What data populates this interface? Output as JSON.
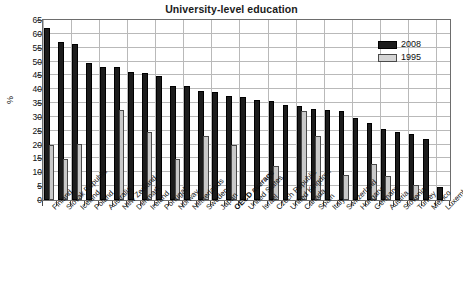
{
  "chart_data": {
    "type": "bar",
    "title": "University-level education",
    "xlabel": "",
    "ylabel": "%",
    "ylim": [
      0,
      65
    ],
    "ytick_step": 5,
    "yticks": [
      0,
      5,
      10,
      15,
      20,
      25,
      30,
      35,
      40,
      45,
      50,
      55,
      60,
      65
    ],
    "grid": true,
    "legend_position": "top-right",
    "highlight_category": "OECD average",
    "colors": {
      "series_2008": "#1c1c1c",
      "series_1995": "#c9c9c9",
      "grid": "#b9b9b9",
      "axis": "#6d6d6d",
      "text": "#111111"
    },
    "categories": [
      "Finland",
      "Slovak Republic",
      "Iceland",
      "Poland",
      "Australia",
      "New Zealand",
      "Denmark",
      "Ireland",
      "Portugal",
      "Norway",
      "Netherlands",
      "Sweden",
      "Japan",
      "OECD average",
      "United States",
      "Israel",
      "Czech Republic",
      "United Kingdom",
      "Canada",
      "Spain",
      "Italy",
      "Switzerland",
      "Hungary",
      "Germany",
      "Austria",
      "Slovenia",
      "Turkey",
      "Mexico",
      "Luxembourg"
    ],
    "series": [
      {
        "name": "2008",
        "values": [
          62.0,
          57.0,
          56.5,
          49.5,
          48.2,
          48.0,
          46.3,
          45.7,
          44.8,
          41.3,
          41.0,
          39.4,
          39.1,
          37.4,
          37.1,
          36.2,
          35.7,
          34.4,
          34.1,
          33.0,
          32.4,
          32.2,
          29.6,
          27.8,
          25.5,
          24.5,
          23.8,
          22.2,
          4.8
        ]
      },
      {
        "name": "1995",
        "values": [
          20.0,
          14.8,
          20.2,
          0.0,
          0.0,
          32.4,
          0.0,
          24.6,
          0.0,
          14.9,
          0.0,
          23.1,
          0.0,
          19.8,
          0.0,
          0.0,
          12.2,
          0.0,
          32.1,
          23.2,
          0.0,
          8.9,
          0.0,
          13.1,
          8.7,
          0.0,
          5.3,
          0.0,
          0.0
        ]
      }
    ]
  },
  "legend": {
    "entries": [
      {
        "label": "2008"
      },
      {
        "label": "1995"
      }
    ]
  }
}
